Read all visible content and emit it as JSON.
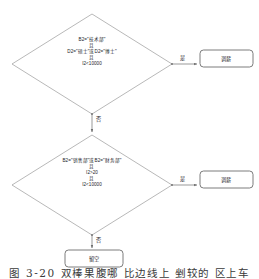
{
  "figure": {
    "caption": "图 3-20  双棒果腹哪  比边线上 剉较的 区上车",
    "background_color": "#ffffff",
    "stroke_color": "#9a9a9a",
    "text_color": "#23242a"
  },
  "nodes": [
    {
      "id": "decision-1",
      "type": "decision",
      "shape": "diamond",
      "lines": [
        "B2=\"技术部\"",
        "且",
        "D2=\"硕士\"或D2=\"博士\"",
        "且",
        "I2<10000"
      ]
    },
    {
      "id": "decision-2",
      "type": "decision",
      "shape": "diamond",
      "lines": [
        "B2=\"销售部\"或B2=\"财务部\"",
        "且",
        "I2>20",
        "且",
        "I2<10000"
      ]
    },
    {
      "id": "result-1",
      "type": "terminator",
      "shape": "rounded-rect",
      "label": "调薪"
    },
    {
      "id": "result-2",
      "type": "terminator",
      "shape": "rounded-rect",
      "label": "调薪"
    },
    {
      "id": "result-3",
      "type": "terminator",
      "shape": "rounded-rect",
      "label": "留空"
    }
  ],
  "edges": [
    {
      "id": "edge-yes-1",
      "from": "decision-1",
      "to": "result-1",
      "label": "是",
      "direction": "right"
    },
    {
      "id": "edge-no-1",
      "from": "decision-1",
      "to": "decision-2",
      "label": "否",
      "direction": "down"
    },
    {
      "id": "edge-yes-2",
      "from": "decision-2",
      "to": "result-2",
      "label": "是",
      "direction": "right"
    },
    {
      "id": "edge-no-2",
      "from": "decision-2",
      "to": "result-3",
      "label": "否",
      "direction": "down"
    }
  ]
}
